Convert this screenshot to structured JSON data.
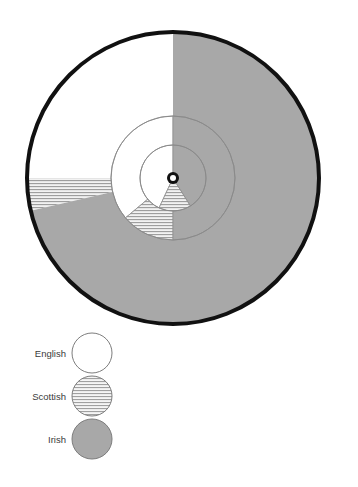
{
  "chart_data": {
    "type": "pie",
    "title": "",
    "subtitle": "",
    "xlabel": "",
    "ylabel": "",
    "variant": "nested-concentric-pie",
    "ring_count": 3,
    "categories": [
      "English",
      "Scottish",
      "Irish"
    ],
    "legend": {
      "position": "bottom-left",
      "entries": [
        {
          "label": "English",
          "swatch": "white",
          "color": "#ffffff",
          "pattern": "solid"
        },
        {
          "label": "Scottish",
          "swatch": "hatched",
          "color": "#e8e8e8",
          "pattern": "horizontal-lines"
        },
        {
          "label": "Irish",
          "swatch": "gray",
          "color": "#a8a8a8",
          "pattern": "solid"
        }
      ]
    },
    "center": {
      "x": 173,
      "y": 178
    },
    "rings": [
      {
        "name": "outer-ring",
        "radius": 146,
        "stroke": "#111111",
        "stroke_width": 4,
        "slices": [
          {
            "label": "English",
            "start_angle": 0,
            "end_angle": 90,
            "value": 25.0,
            "color": "#ffffff",
            "pattern": "solid"
          },
          {
            "label": "Scottish",
            "start_angle": 90,
            "end_angle": 103,
            "value": 3.6,
            "color": "#e8e8e8",
            "pattern": "horizontal-lines"
          },
          {
            "label": "Irish",
            "start_angle": 103,
            "end_angle": 360,
            "value": 71.4,
            "color": "#a8a8a8",
            "pattern": "solid"
          }
        ]
      },
      {
        "name": "middle-ring",
        "radius": 62,
        "stroke": "#8a8a8a",
        "stroke_width": 1,
        "slices": [
          {
            "label": "English",
            "start_angle": 0,
            "end_angle": 130,
            "value": 36.1,
            "color": "#ffffff",
            "pattern": "solid"
          },
          {
            "label": "Scottish",
            "start_angle": 130,
            "end_angle": 180,
            "value": 13.9,
            "color": "#e8e8e8",
            "pattern": "horizontal-lines"
          },
          {
            "label": "Irish",
            "start_angle": 180,
            "end_angle": 360,
            "value": 50.0,
            "color": "#a8a8a8",
            "pattern": "solid"
          }
        ]
      },
      {
        "name": "inner-ring",
        "radius": 33,
        "stroke": "#8a8a8a",
        "stroke_width": 1,
        "slices": [
          {
            "label": "English",
            "start_angle": 0,
            "end_angle": 155,
            "value": 43.1,
            "color": "#ffffff",
            "pattern": "solid"
          },
          {
            "label": "Scottish",
            "start_angle": 155,
            "end_angle": 212,
            "value": 15.8,
            "color": "#e8e8e8",
            "pattern": "horizontal-lines"
          },
          {
            "label": "Irish",
            "start_angle": 212,
            "end_angle": 360,
            "value": 41.1,
            "color": "#a8a8a8",
            "pattern": "solid"
          }
        ]
      }
    ],
    "hub": {
      "outer_radius": 6,
      "inner_radius": 3,
      "color": "#111111",
      "fill": "#ffffff"
    },
    "grid": false
  }
}
